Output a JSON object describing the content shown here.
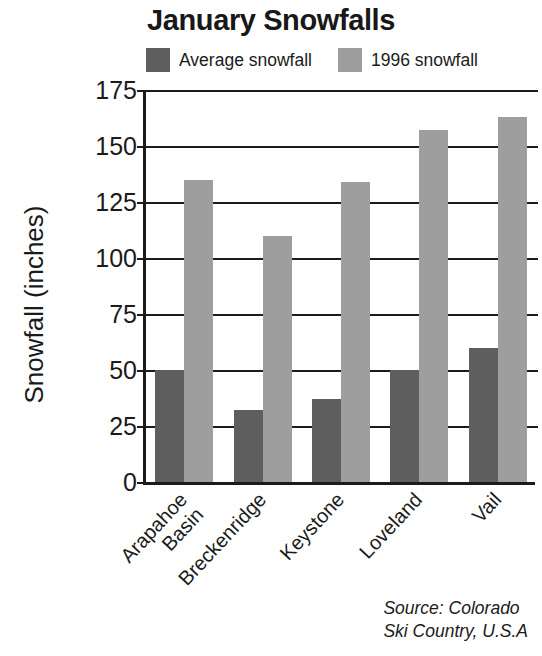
{
  "chart_data": {
    "type": "bar",
    "title": "January Snowfalls",
    "xlabel": "",
    "ylabel": "Snowfall (inches)",
    "ylim": [
      0,
      175
    ],
    "yticks": [
      0,
      25,
      50,
      75,
      100,
      125,
      150,
      175
    ],
    "grid": true,
    "legend_position": "top",
    "categories": [
      "Arapahoe Basin",
      "Breckenridge",
      "Keystone",
      "Loveland",
      "Vail"
    ],
    "category_lines": [
      [
        "Arapahoe",
        "Basin"
      ],
      [
        "Breckenridge",
        ""
      ],
      [
        "Keystone",
        ""
      ],
      [
        "Loveland",
        ""
      ],
      [
        "Vail",
        ""
      ]
    ],
    "series": [
      {
        "name": "Average snowfall",
        "color": "#5e5e5e",
        "values": [
          50,
          32,
          37,
          50,
          60
        ]
      },
      {
        "name": "1996 snowfall",
        "color": "#9e9e9e",
        "values": [
          135,
          110,
          134,
          157,
          163
        ]
      }
    ],
    "annotations": [
      "Source: Colorado",
      "Ski Country, U.S.A"
    ]
  },
  "legend": {
    "entries": [
      {
        "label": "Average snowfall",
        "color": "#5e5e5e",
        "swatch_name": "legend-swatch-average"
      },
      {
        "label": "1996 snowfall",
        "color": "#9e9e9e",
        "swatch_name": "legend-swatch-1996"
      }
    ]
  },
  "axis": {
    "y_title": "Snowfall (inches)",
    "y_tick_labels": [
      "175",
      "150",
      "125",
      "100",
      "75",
      "50",
      "25",
      "0"
    ]
  },
  "source": {
    "line1": "Source: Colorado",
    "line2": "Ski Country, U.S.A"
  },
  "colors": {
    "axis": "#1b1b1b",
    "text": "#1b1b1b",
    "background": "#ffffff",
    "series_average": "#5e5e5e",
    "series_1996": "#9e9e9e"
  }
}
